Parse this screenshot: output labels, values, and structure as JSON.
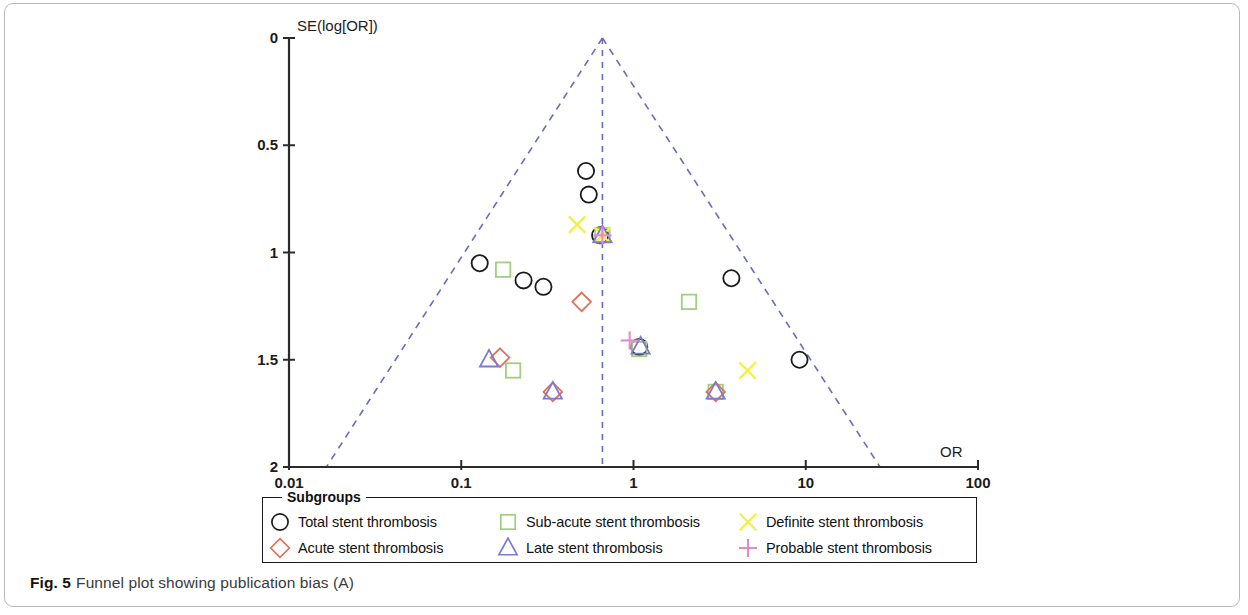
{
  "figure": {
    "caption_label": "Fig. 5",
    "caption_text": "Funnel plot showing publication bias (A)"
  },
  "legend": {
    "title": "Subgroups",
    "entries": [
      {
        "label": "Total stent thrombosis",
        "marker": "circle",
        "color": "#1a1a1a"
      },
      {
        "label": "Sub-acute stent thrombosis",
        "marker": "square",
        "color": "#9fcf7f"
      },
      {
        "label": "Definite stent thrombosis",
        "marker": "cross-x",
        "color": "#f2ef4a"
      },
      {
        "label": "Acute stent thrombosis",
        "marker": "diamond",
        "color": "#e2705a"
      },
      {
        "label": "Late stent thrombosis",
        "marker": "triangle",
        "color": "#7b7bd4"
      },
      {
        "label": "Probable stent thrombosis",
        "marker": "plus",
        "color": "#e08ad0"
      }
    ]
  },
  "chart_data": {
    "type": "scatter",
    "title": "",
    "xlabel": "OR",
    "ylabel": "SE(log[OR])",
    "xscale": "log",
    "xlim": [
      0.01,
      100
    ],
    "ylim": [
      0,
      2
    ],
    "y_inverted": true,
    "xticks": [
      "0.01",
      "0.1",
      "1",
      "10",
      "100"
    ],
    "xtick_values": [
      0.01,
      0.1,
      1,
      10,
      100
    ],
    "yticks": [
      "0",
      "0.5",
      "1",
      "1.5",
      "2"
    ],
    "ytick_values": [
      0,
      0.5,
      1,
      1.5,
      2
    ],
    "grid": false,
    "legend_position": "below-axes",
    "funnel": {
      "center_or": 0.66,
      "apex_se": 0,
      "base_se": 2,
      "left_base_or": 0.0165,
      "right_base_or": 27.0,
      "line_color": "#6a6ac0",
      "line_style": "dashed"
    },
    "series": [
      {
        "name": "Total stent thrombosis",
        "marker": "circle",
        "color": "#1a1a1a",
        "points": [
          {
            "or": 0.53,
            "se": 0.62
          },
          {
            "or": 0.55,
            "se": 0.73
          },
          {
            "or": 0.64,
            "se": 0.92
          },
          {
            "or": 0.128,
            "se": 1.05
          },
          {
            "or": 0.23,
            "se": 1.13
          },
          {
            "or": 0.3,
            "se": 1.16
          },
          {
            "or": 3.7,
            "se": 1.12
          },
          {
            "or": 1.08,
            "se": 1.44
          },
          {
            "or": 9.2,
            "se": 1.5
          }
        ]
      },
      {
        "name": "Sub-acute stent thrombosis",
        "marker": "square",
        "color": "#9fcf7f",
        "points": [
          {
            "or": 0.175,
            "se": 1.08
          },
          {
            "or": 2.1,
            "se": 1.23
          },
          {
            "or": 0.2,
            "se": 1.55
          },
          {
            "or": 0.66,
            "se": 0.92
          },
          {
            "or": 3.0,
            "se": 1.65
          },
          {
            "or": 1.08,
            "se": 1.45
          }
        ]
      },
      {
        "name": "Definite stent thrombosis",
        "marker": "cross-x",
        "color": "#f2ef4a",
        "points": [
          {
            "or": 0.47,
            "se": 0.87
          },
          {
            "or": 4.6,
            "se": 1.55
          },
          {
            "or": 0.66,
            "se": 0.92
          }
        ]
      },
      {
        "name": "Acute stent thrombosis",
        "marker": "diamond",
        "color": "#e2705a",
        "points": [
          {
            "or": 0.5,
            "se": 1.23
          },
          {
            "or": 0.168,
            "se": 1.49
          },
          {
            "or": 0.34,
            "se": 1.65
          },
          {
            "or": 3.0,
            "se": 1.65
          }
        ]
      },
      {
        "name": "Late stent thrombosis",
        "marker": "triangle",
        "color": "#7b7bd4",
        "points": [
          {
            "or": 0.145,
            "se": 1.5
          },
          {
            "or": 0.34,
            "se": 1.65
          },
          {
            "or": 1.1,
            "se": 1.44
          },
          {
            "or": 3.0,
            "se": 1.65
          },
          {
            "or": 0.66,
            "se": 0.92
          }
        ]
      },
      {
        "name": "Probable stent thrombosis",
        "marker": "plus",
        "color": "#e08ad0",
        "points": [
          {
            "or": 0.95,
            "se": 1.41
          },
          {
            "or": 0.66,
            "se": 0.92
          }
        ]
      }
    ]
  }
}
